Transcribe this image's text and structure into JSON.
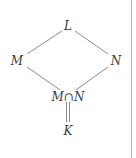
{
  "diagram": {
    "type": "lattice-diagram",
    "nodes": [
      {
        "id": "L",
        "label": "L",
        "x": 68,
        "y": 26
      },
      {
        "id": "M",
        "label": "M",
        "x": 17,
        "y": 61
      },
      {
        "id": "N",
        "label": "N",
        "x": 116,
        "y": 61
      },
      {
        "id": "MN",
        "label": "M∩N",
        "x": 68,
        "y": 97
      },
      {
        "id": "K",
        "label": "K",
        "x": 68,
        "y": 131
      }
    ],
    "edges": [
      {
        "from": "L",
        "to": "M",
        "style": "single"
      },
      {
        "from": "L",
        "to": "N",
        "style": "single"
      },
      {
        "from": "M",
        "to": "MN",
        "style": "single"
      },
      {
        "from": "N",
        "to": "MN",
        "style": "single"
      },
      {
        "from": "MN",
        "to": "K",
        "style": "double"
      }
    ],
    "colors": {
      "line": "#8a8a8a",
      "text": "#3a3a3a",
      "border": "#b8b8b8"
    }
  }
}
